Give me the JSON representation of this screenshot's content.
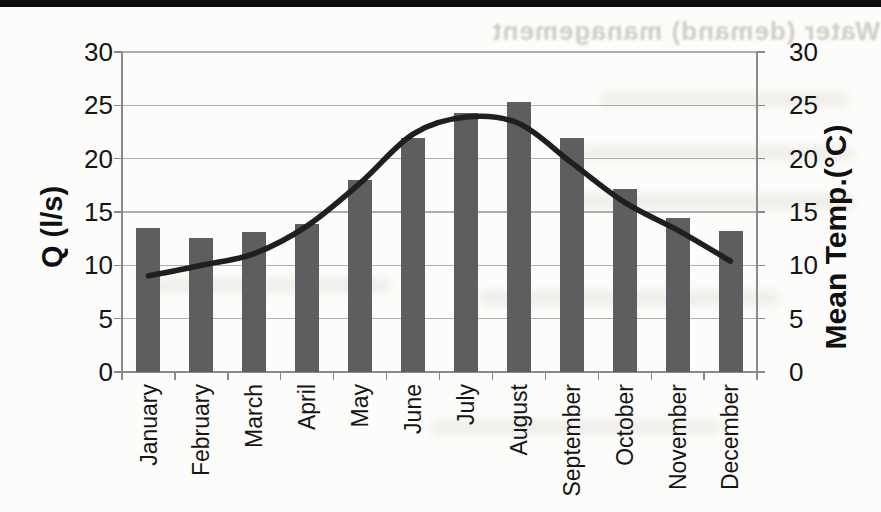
{
  "page": {
    "ghost_text": "Water (demand) management",
    "background_color": "#fcfcfa",
    "top_rule_color": "#0e0e0e"
  },
  "chart_data": {
    "type": "bar+line combo, dual axis",
    "title": "",
    "legend": "none",
    "grid": true,
    "categories": [
      "January",
      "February",
      "March",
      "April",
      "May",
      "June",
      "July",
      "August",
      "September",
      "October",
      "November",
      "December"
    ],
    "series": [
      {
        "name": "Q (l/s)",
        "type": "bar",
        "axis": "left",
        "color": "#5e5e60",
        "values": [
          13.5,
          12.6,
          13.1,
          13.9,
          18.0,
          21.9,
          24.3,
          25.3,
          21.9,
          17.2,
          14.4,
          13.2
        ]
      },
      {
        "name": "Mean Temp.(°C)",
        "type": "line",
        "axis": "right",
        "color": "#1f1f1f",
        "values": [
          9.0,
          10.0,
          11.1,
          13.7,
          17.7,
          22.3,
          23.9,
          23.3,
          19.6,
          15.9,
          13.3,
          10.4
        ]
      }
    ],
    "left_axis": {
      "label": "Q (l/s)",
      "min": 0,
      "max": 30,
      "step": 5,
      "tick_labels": [
        "0",
        "5",
        "10",
        "15",
        "20",
        "25",
        "30"
      ]
    },
    "right_axis": {
      "label": "Mean Temp.(°C)",
      "min": 0,
      "max": 30,
      "step": 5,
      "tick_labels": [
        "0",
        "5",
        "10",
        "15",
        "20",
        "25",
        "30"
      ]
    }
  },
  "colors": {
    "gridline": "#aeaeae",
    "axis": "#8a8a8a",
    "tick_text": "#151515"
  }
}
